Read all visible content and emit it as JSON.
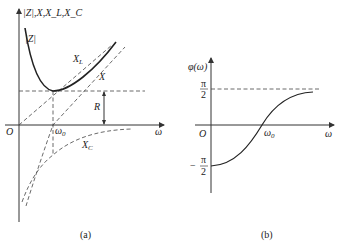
{
  "figure_a": {
    "y_axis_label": "|Z|,X,X_L,X_C",
    "x_axis_label": "ω",
    "origin_label": "O",
    "omega0_label": "ω",
    "omega0_sub": "0",
    "curve_Z_label": "|Z|",
    "curve_XL_label": "X",
    "curve_XL_sub": "L",
    "curve_X_label": "X",
    "curve_XC_label": "X",
    "curve_XC_sub": "C",
    "R_label": "R",
    "caption": "(a)"
  },
  "figure_b": {
    "y_axis_label": "φ(ω)",
    "x_axis_label": "ω",
    "origin_label": "O",
    "omega0_label": "ω",
    "omega0_sub": "0",
    "pi_num": "π",
    "pi_den": "2",
    "neg_sign": "−",
    "caption": "(b)"
  }
}
